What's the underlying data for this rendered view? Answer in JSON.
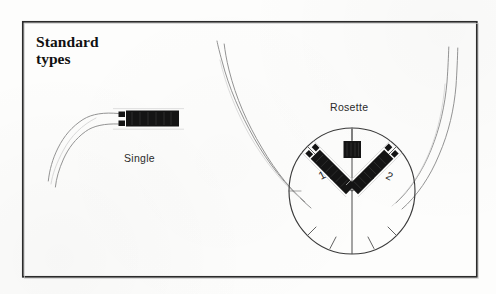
{
  "figure": {
    "title": "Standard types",
    "title_lines": [
      "Standard",
      "types"
    ],
    "background_color": "#fdfdfc",
    "ink_color": "#1a1a1a",
    "frame": {
      "name": "figure-border",
      "x": 22,
      "y": 21,
      "width": 455,
      "height": 256,
      "stroke_color": "#2b2b2b",
      "stroke_width": 1.6
    }
  },
  "single": {
    "label": "Single",
    "gauge": {
      "kind": "single-element-strain-gauge",
      "body_color": "#141414",
      "x": 117,
      "y": 111,
      "width": 62,
      "height": 15,
      "tab_count": 2
    },
    "leads": {
      "count": 2,
      "stroke_color": "#8a8a8a",
      "stroke_width": 0.9,
      "direction": "sweeps down and left"
    }
  },
  "rosette": {
    "label": "Rosette",
    "circle": {
      "center_x": 352,
      "center_y": 191,
      "radius": 63,
      "stroke_color": "#3a3a3a",
      "stroke_width": 1.1
    },
    "elements": [
      {
        "name": "gauge-top",
        "number": "",
        "angle_deg": 90,
        "shape": "square",
        "body_color": "#141414",
        "size": 17
      },
      {
        "name": "gauge-1",
        "number": "1",
        "angle_deg": 135,
        "shape": "bar",
        "body_color": "#141414",
        "length": 64,
        "thickness": 13
      },
      {
        "name": "gauge-2",
        "number": "2",
        "angle_deg": 45,
        "shape": "bar",
        "body_color": "#141414",
        "length": 64,
        "thickness": 13
      }
    ],
    "tick_marks": {
      "count": 8,
      "stroke_color": "#5a5a5a",
      "stroke_width": 0.9
    },
    "axis_lines": {
      "vertical": true,
      "v_splay": true,
      "stroke_color": "#4a4a4a"
    },
    "leads": {
      "left_pair": 2,
      "right_pair": 2,
      "stroke_color": "#8a8a8a",
      "stroke_width": 0.9
    }
  }
}
